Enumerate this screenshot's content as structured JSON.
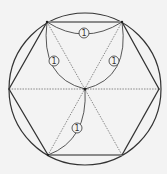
{
  "diagram": {
    "colors": {
      "background": "#f3f3f3",
      "stroke": "#333333",
      "edge_gray": "#8a8a8a",
      "dotted": "#7a7a7a"
    },
    "circle": {
      "cx": 85,
      "cy": 89,
      "r": 76
    },
    "center": {
      "x": 85,
      "y": 89
    },
    "vertices": {
      "left": [
        9,
        89
      ],
      "top_left": [
        47,
        22
      ],
      "top_right": [
        122,
        22
      ],
      "right": [
        159,
        89
      ],
      "bottom_right": [
        122,
        155
      ],
      "bottom_left": [
        48,
        155
      ]
    },
    "labels": [
      {
        "id": "top",
        "text": "1",
        "x": 84,
        "y": 33
      },
      {
        "id": "left",
        "text": "1",
        "x": 54,
        "y": 61
      },
      {
        "id": "right",
        "text": "1",
        "x": 114,
        "y": 61
      },
      {
        "id": "bottom",
        "text": "1",
        "x": 77,
        "y": 128
      }
    ]
  }
}
